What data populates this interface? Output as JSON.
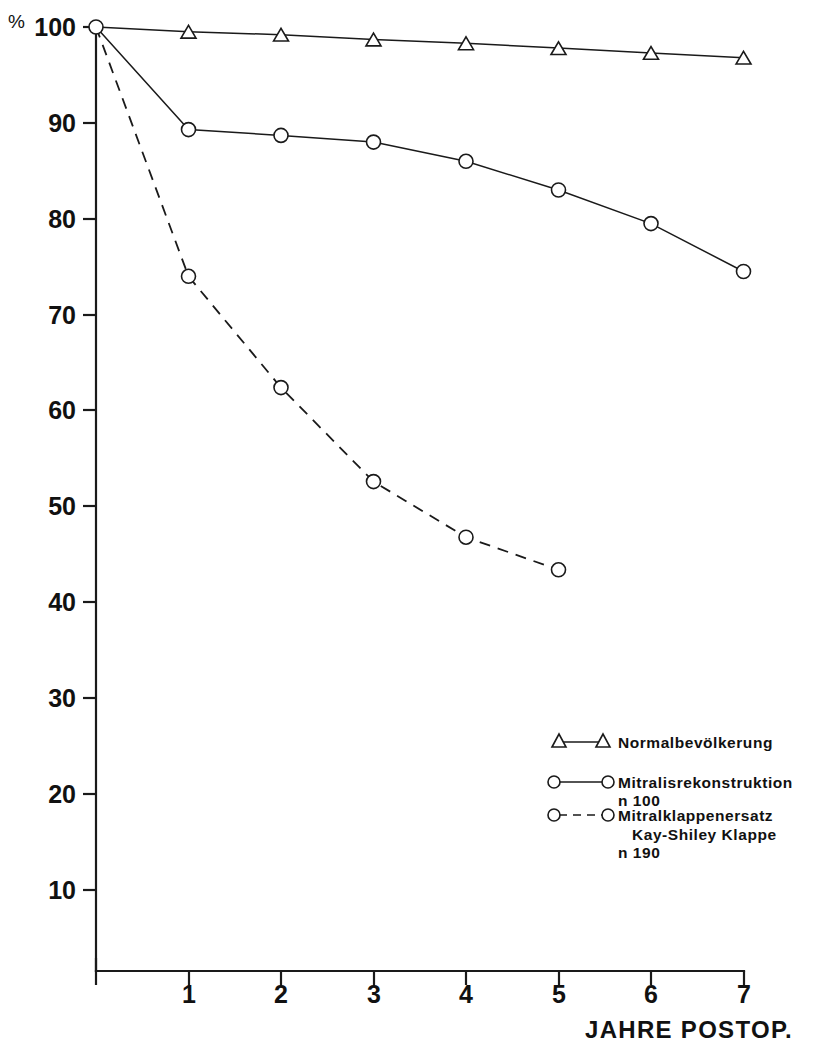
{
  "chart_data": {
    "type": "line",
    "title": "",
    "xlabel": "JAHRE POSTOP.",
    "ylabel": "%",
    "x": [
      0,
      1,
      2,
      3,
      4,
      5,
      6,
      7
    ],
    "xlim": [
      0,
      7
    ],
    "ylim": [
      0,
      100
    ],
    "xticks": [
      "1",
      "2",
      "3",
      "4",
      "5",
      "6",
      "7"
    ],
    "xtick_values": [
      1,
      2,
      3,
      4,
      5,
      6,
      7
    ],
    "yticks": [
      "10",
      "20",
      "30",
      "40",
      "50",
      "60",
      "70",
      "80",
      "90",
      "100"
    ],
    "ytick_values": [
      10,
      20,
      30,
      40,
      50,
      60,
      70,
      80,
      90,
      100
    ],
    "grid": false,
    "legend_position": "center-right",
    "series": [
      {
        "name": "Normalbevölkerung",
        "marker": "triangle",
        "linestyle": "solid",
        "x": [
          0,
          1,
          2,
          3,
          4,
          5,
          6,
          7
        ],
        "values": [
          100,
          99.5,
          99.2,
          98.7,
          98.3,
          97.8,
          97.3,
          96.8
        ]
      },
      {
        "name": "Mitralisrekonstruktion",
        "sublabel": "n 100",
        "marker": "circle",
        "linestyle": "solid",
        "x": [
          0,
          1,
          2,
          3,
          4,
          5,
          6,
          7
        ],
        "values": [
          100,
          89.3,
          88.7,
          88.0,
          86.0,
          83.0,
          79.5,
          74.5
        ]
      },
      {
        "name": "Mitralklappenersatz",
        "sublabel": "Kay-Shiley Klappe",
        "sublabel2": "n 190",
        "marker": "circle",
        "linestyle": "dashed",
        "x": [
          0,
          1,
          2,
          3,
          4,
          5
        ],
        "values": [
          100,
          74.0,
          62.4,
          52.6,
          46.8,
          43.4
        ]
      }
    ]
  },
  "legend": {
    "entries": [
      {
        "label": "Normalbevölkerung",
        "sub1": "",
        "sub2": ""
      },
      {
        "label": "Mitralisrekonstruktion",
        "sub1": "n 100",
        "sub2": ""
      },
      {
        "label": "Mitralklappenersatz",
        "sub1": "Kay-Shiley Klappe",
        "sub2": "n 190"
      }
    ]
  },
  "axes": {
    "y_unit": "%",
    "x_title": "JAHRE POSTOP.",
    "y_tick_labels": [
      "100",
      "90",
      "80",
      "70",
      "60",
      "50",
      "40",
      "30",
      "20",
      "10"
    ],
    "x_tick_labels": [
      "1",
      "2",
      "3",
      "4",
      "5",
      "6",
      "7"
    ]
  },
  "colors": {
    "ink": "#1a1a1a",
    "background": "#ffffff"
  }
}
